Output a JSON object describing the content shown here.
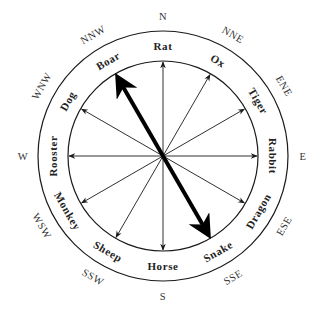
{
  "diagram": {
    "center": {
      "x": 163,
      "y": 156
    },
    "inner_radius": 95,
    "outer_radius": 125,
    "line_color": "#1a1a1a",
    "background": "#ffffff",
    "animals": [
      {
        "label": "Rat",
        "angle": 0
      },
      {
        "label": "Ox",
        "angle": 30
      },
      {
        "label": "Tiger",
        "angle": 60
      },
      {
        "label": "Rabbit",
        "angle": 90
      },
      {
        "label": "Dragon",
        "angle": 120
      },
      {
        "label": "Snake",
        "angle": 150
      },
      {
        "label": "Horse",
        "angle": 180
      },
      {
        "label": "Sheep",
        "angle": 210
      },
      {
        "label": "Monkey",
        "angle": 240
      },
      {
        "label": "Rooster",
        "angle": 270
      },
      {
        "label": "Dog",
        "angle": 300
      },
      {
        "label": "Boar",
        "angle": 330
      }
    ],
    "directions": [
      {
        "label": "N",
        "angle": 0
      },
      {
        "label": "NNE",
        "angle": 30
      },
      {
        "label": "ENE",
        "angle": 60
      },
      {
        "label": "E",
        "angle": 90
      },
      {
        "label": "ESE",
        "angle": 120
      },
      {
        "label": "SSE",
        "angle": 150
      },
      {
        "label": "S",
        "angle": 180
      },
      {
        "label": "SSW",
        "angle": 210
      },
      {
        "label": "WSW",
        "angle": 240
      },
      {
        "label": "W",
        "angle": 270
      },
      {
        "label": "WNW",
        "angle": 300
      },
      {
        "label": "NNW",
        "angle": 330
      }
    ],
    "highlight_axis": {
      "from": "Boar",
      "to": "Snake",
      "from_angle": 330,
      "to_angle": 150
    }
  }
}
